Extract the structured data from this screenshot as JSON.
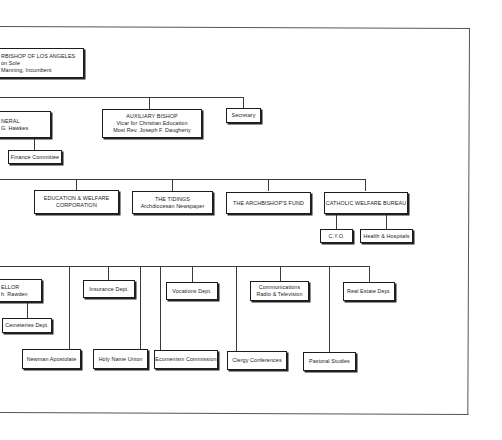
{
  "diagram": {
    "type": "organization-chart",
    "nodes": {
      "archbishop": {
        "lines": [
          "RBISHOP OF LOS ANGELES",
          "on Sole",
          "Manning, Incumbent"
        ]
      },
      "vicar_general": {
        "lines": [
          "NERAL",
          "G. Hawkes"
        ]
      },
      "finance_committee": {
        "lines": [
          "Finance Committee"
        ]
      },
      "auxiliary_bishop": {
        "lines": [
          "AUXILIARY BISHOP",
          "Vicar for Christian Education",
          "Most Rev. Joseph F. Daugherty"
        ]
      },
      "secretary": {
        "lines": [
          "Secretary"
        ]
      },
      "education_welfare": {
        "lines": [
          "EDUCATION & WELFARE",
          "CORPORATION"
        ]
      },
      "the_tidings": {
        "lines": [
          "THE TIDINGS",
          "Archdiocesan Newspaper"
        ]
      },
      "archbishops_fund": {
        "lines": [
          "THE ARCHBISHOP'S FUND"
        ]
      },
      "catholic_welfare_bureau": {
        "lines": [
          "CATHOLIC WELFARE BUREAU"
        ]
      },
      "cyo": {
        "lines": [
          "C.Y.O."
        ]
      },
      "health_hospitals": {
        "lines": [
          "Health & Hospitals"
        ]
      },
      "chancellor": {
        "lines": [
          "ELLOR",
          "h. Rawden"
        ]
      },
      "cemeteries": {
        "lines": [
          "Cemeteries Dept."
        ]
      },
      "insurance": {
        "lines": [
          "Insurance Dept."
        ]
      },
      "vocations": {
        "lines": [
          "Vocations Dept."
        ]
      },
      "communications": {
        "lines": [
          "Communications",
          "Radio & Television"
        ]
      },
      "real_estate": {
        "lines": [
          "Real Estate Dept."
        ]
      },
      "newman": {
        "lines": [
          "Newman Apostolate"
        ]
      },
      "holy_name": {
        "lines": [
          "Holy Name Union"
        ]
      },
      "ecumenism": {
        "lines": [
          "Ecumenism Commission"
        ]
      },
      "clergy_conferences": {
        "lines": [
          "Clergy Conferences"
        ]
      },
      "pastoral_studies": {
        "lines": [
          "Pastoral Studies"
        ]
      }
    }
  }
}
